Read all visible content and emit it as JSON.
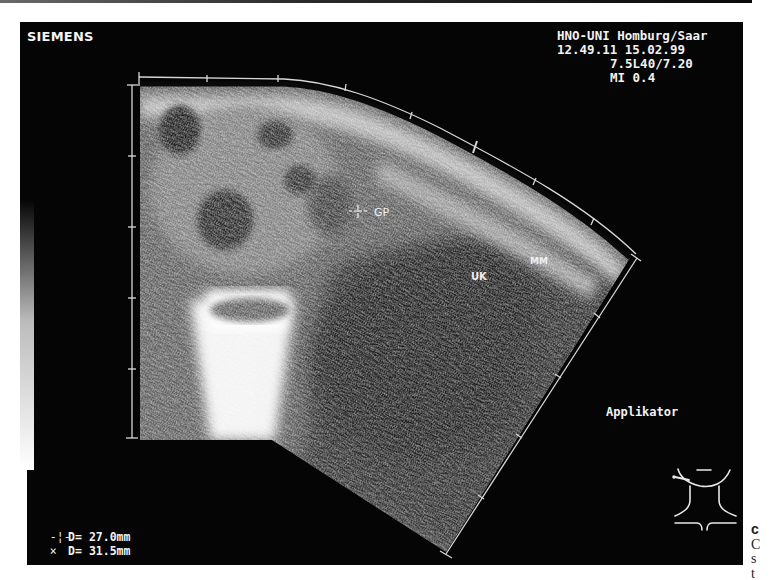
{
  "scanner": {
    "brand": "SIEMENS",
    "institution": "HNO-UNI Homburg/Saar",
    "datetime": "12.49.11 15.02.99",
    "transducer": "7.5L40/7.20",
    "mechanical_index": "MI 0.4"
  },
  "annotations": {
    "gp": "GP",
    "uk": "UK",
    "mm": "MM",
    "applicator": "Applikator"
  },
  "measurements": [
    {
      "marker": "-¦-",
      "symbol": "plus-cursor",
      "label": "D=",
      "value": "27.0mm"
    },
    {
      "marker": "×",
      "symbol": "x-cursor",
      "label": "D=",
      "value": "31.5mm"
    }
  ],
  "caption_fragment": {
    "line1": "c",
    "line2": "C",
    "line3": "s",
    "line4": "t"
  },
  "colors": {
    "background": "#050505",
    "overlay_text": "#f2f2f2",
    "page": "#ffffff"
  }
}
